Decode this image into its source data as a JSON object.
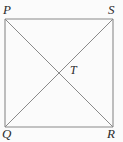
{
  "figure": {
    "type": "square-with-diagonals",
    "background_color": "#fbfbfb",
    "line_color": "#808080",
    "label_color": "#2b2b2b",
    "square": {
      "left": 5,
      "top": 19,
      "right": 113,
      "bottom": 127
    },
    "vertices": [
      {
        "id": "P",
        "label": "P",
        "position": "top-left",
        "x": 5,
        "y": 19
      },
      {
        "id": "S",
        "label": "S",
        "position": "top-right",
        "x": 113,
        "y": 19
      },
      {
        "id": "Q",
        "label": "Q",
        "position": "bottom-left",
        "x": 5,
        "y": 127
      },
      {
        "id": "R",
        "label": "R",
        "position": "bottom-right",
        "x": 113,
        "y": 127
      }
    ],
    "intersection": {
      "id": "T",
      "label": "T",
      "x": 59,
      "y": 73
    },
    "edges": [
      {
        "name": "PS",
        "from": "P",
        "to": "S"
      },
      {
        "name": "SR",
        "from": "S",
        "to": "R"
      },
      {
        "name": "RQ",
        "from": "R",
        "to": "Q"
      },
      {
        "name": "QP",
        "from": "Q",
        "to": "P"
      }
    ],
    "diagonals": [
      {
        "name": "PR",
        "from": "P",
        "to": "R"
      },
      {
        "name": "QS",
        "from": "Q",
        "to": "S"
      }
    ]
  }
}
